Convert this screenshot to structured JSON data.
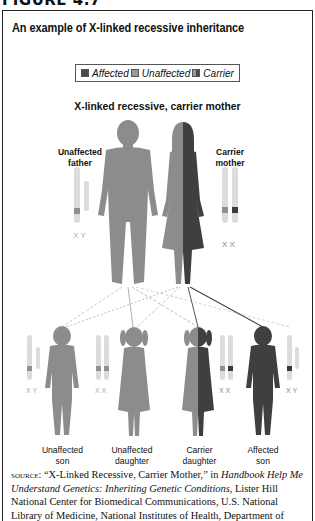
{
  "figure_heading": "FIGURE 4.7",
  "title": "An example of X-linked recessive inheritance",
  "legend": [
    {
      "label": "Affected",
      "color": "#4a4a4a"
    },
    {
      "label": "Unaffected",
      "color": "#9a9a9a"
    },
    {
      "label": "Carrier",
      "color": "#6e6e6e"
    }
  ],
  "subtitle": "X-linked recessive, carrier mother",
  "parents": [
    {
      "role": "father",
      "label_line1": "Unaffected",
      "label_line2": "father",
      "chromosomes": "X Y"
    },
    {
      "role": "mother",
      "label_line1": "Carrier",
      "label_line2": "mother",
      "chromosomes": "X X"
    }
  ],
  "children": [
    {
      "label_line1": "Unaffected",
      "label_line2": "son",
      "chromosomes": "X Y"
    },
    {
      "label_line1": "Unaffected",
      "label_line2": "daughter",
      "chromosomes": "X X"
    },
    {
      "label_line1": "Carrier",
      "label_line2": "daughter",
      "chromosomes": "X X"
    },
    {
      "label_line1": "Affected",
      "label_line2": "son",
      "chromosomes": "X Y"
    }
  ],
  "colors": {
    "affected": "#3f3f3f",
    "unaffected": "#8c8c8c",
    "chromosome": "#d9d9d9",
    "band_normal": "#8f8f8f",
    "band_mutant": "#3a3a3a"
  },
  "source": {
    "prefix": "source:",
    "quote": " “X-Linked Recessive, Carrier Mother,” in ",
    "book": "Handbook Help Me Understand Genetics: Inheriting Genetic Conditions",
    "rest": ", Lister Hill National Center for Biomedical Communications, U.S. National Library of Medicine, National Institutes of Health, Department of"
  }
}
